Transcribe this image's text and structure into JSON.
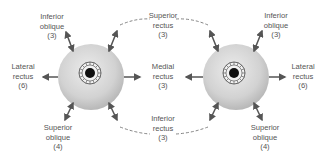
{
  "diagram": {
    "colors": {
      "eyeball_light": "#e4e4e4",
      "eyeball_dark": "#bdbdbd",
      "arrow": "#555555",
      "pupil": "#111111",
      "iris_lines": "#444444",
      "text": "#555555",
      "dashed": "#777777"
    },
    "eyes": [
      {
        "id": "left-eye",
        "cx": 91,
        "cy": 77,
        "r": 33,
        "iris_cx": 90,
        "iris_cy": 73
      },
      {
        "id": "right-eye",
        "cx": 236,
        "cy": 77,
        "r": 33,
        "iris_cx": 234,
        "iris_cy": 73
      }
    ],
    "labels": {
      "left_inferior_oblique": {
        "line1": "Inferior",
        "line2": "oblique",
        "line3": "(3)"
      },
      "left_lateral_rectus": {
        "line1": "Lateral",
        "line2": "rectus",
        "line3": "(6)"
      },
      "left_superior_oblique": {
        "line1": "Superior",
        "line2": "oblique",
        "line3": "(4)"
      },
      "superior_rectus": {
        "line1": "Superior",
        "line2": "rectus",
        "line3": "(3)"
      },
      "medial_rectus": {
        "line1": "Medial",
        "line2": "rectus",
        "line3": "(3)"
      },
      "inferior_rectus": {
        "line1": "Inferior",
        "line2": "rectus",
        "line3": "(3)"
      },
      "right_inferior_oblique": {
        "line1": "Inferior",
        "line2": "oblique",
        "line3": "(3)"
      },
      "right_lateral_rectus": {
        "line1": "Lateral",
        "line2": "rectus",
        "line3": "(6)"
      },
      "right_superior_oblique": {
        "line1": "Superior",
        "line2": "oblique",
        "line3": "(4)"
      }
    }
  }
}
